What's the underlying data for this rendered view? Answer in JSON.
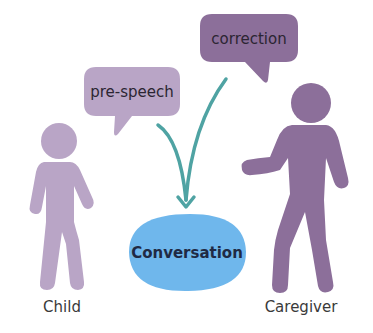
{
  "diagram": {
    "bubbles": [
      {
        "id": "pre-speech",
        "label": "pre-speech",
        "speaker": "Child"
      },
      {
        "id": "correction",
        "label": "correction",
        "speaker": "Caregiver"
      }
    ],
    "target": {
      "label": "Conversation"
    },
    "people": [
      {
        "id": "child",
        "label": "Child"
      },
      {
        "id": "caregiver",
        "label": "Caregiver"
      }
    ],
    "edges": [
      {
        "from": "pre-speech",
        "to": "Conversation"
      },
      {
        "from": "correction",
        "to": "Conversation"
      }
    ],
    "colors": {
      "child_figure": "#b9a5c6",
      "caregiver_figure": "#8c6f9a",
      "pre_speech_bubble": "#b9a5c6",
      "correction_bubble": "#8c6f9a",
      "arrow": "#4fa3a3",
      "conversation_fill": "#6fb7ec"
    }
  }
}
